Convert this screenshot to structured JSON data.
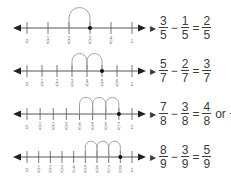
{
  "figure": {
    "type": "fraction-subtraction-number-lines",
    "colors": {
      "line": "#555555",
      "arc": "#9a9a9a",
      "dot": "#111111",
      "text": "#3a3a3a",
      "tick_label": "#777777"
    }
  },
  "rows": [
    {
      "denominator": 5,
      "tick_labels": [
        "0",
        "1/5",
        "2/5",
        "3/5",
        "4/5",
        "1"
      ],
      "start": 3,
      "hops": 1,
      "end": 2,
      "equation": {
        "a": {
          "num": "3",
          "den": "5"
        },
        "minus": "−",
        "b": {
          "num": "1",
          "den": "5"
        },
        "equals": "=",
        "result": {
          "num": "2",
          "den": "5"
        }
      }
    },
    {
      "denominator": 7,
      "tick_labels": [
        "0",
        "1/7",
        "2/7",
        "3/7",
        "4/7",
        "5/7",
        "6/7",
        "1"
      ],
      "start": 5,
      "hops": 2,
      "end": 3,
      "equation": {
        "a": {
          "num": "5",
          "den": "7"
        },
        "minus": "−",
        "b": {
          "num": "2",
          "den": "7"
        },
        "equals": "=",
        "result": {
          "num": "3",
          "den": "7"
        }
      }
    },
    {
      "denominator": 8,
      "tick_labels": [
        "0",
        "1/8",
        "2/8",
        "3/8",
        "4/8",
        "5/8",
        "6/8",
        "7/8",
        "1"
      ],
      "start": 7,
      "hops": 3,
      "end": 4,
      "equation": {
        "a": {
          "num": "7",
          "den": "8"
        },
        "minus": "−",
        "b": {
          "num": "3",
          "den": "8"
        },
        "equals": "=",
        "result": {
          "num": "4",
          "den": "8"
        },
        "or": "or",
        "simplified": {
          "num": "1",
          "den": "2"
        }
      }
    },
    {
      "denominator": 9,
      "tick_labels": [
        "0",
        "1/9",
        "2/9",
        "3/9",
        "4/9",
        "5/9",
        "6/9",
        "7/9",
        "8/9",
        "1"
      ],
      "start": 8,
      "hops": 3,
      "end": 5,
      "equation": {
        "a": {
          "num": "8",
          "den": "9"
        },
        "minus": "−",
        "b": {
          "num": "3",
          "den": "9"
        },
        "equals": "=",
        "result": {
          "num": "5",
          "den": "9"
        }
      }
    }
  ]
}
